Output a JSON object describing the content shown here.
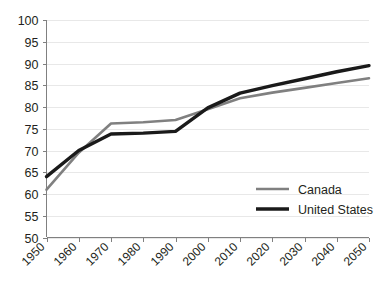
{
  "chart_data": {
    "type": "line",
    "title": "",
    "subtitle": "",
    "xlabel": "",
    "ylabel": "",
    "grid": true,
    "legend_position": "inside-bottom-right",
    "x": [
      1950,
      1960,
      1970,
      1980,
      1990,
      2000,
      2010,
      2020,
      2030,
      2040,
      2050
    ],
    "categories": [
      "1950",
      "1960",
      "1970",
      "1980",
      "1990",
      "2000",
      "2010",
      "2020",
      "2030",
      "2040",
      "2050"
    ],
    "xlim": [
      1950,
      2050
    ],
    "ylim": [
      50,
      100
    ],
    "yticks": [
      50,
      55,
      60,
      65,
      70,
      75,
      80,
      85,
      90,
      95,
      100
    ],
    "ytick_labels": [
      "50",
      "55",
      "60",
      "65",
      "70",
      "75",
      "80",
      "85",
      "90",
      "95",
      "100"
    ],
    "series": [
      {
        "name": "Canada",
        "color": "#808080",
        "values": [
          61.0,
          69.5,
          76.2,
          76.5,
          77.0,
          79.5,
          82.0,
          83.3,
          84.4,
          85.5,
          86.6
        ]
      },
      {
        "name": "United States",
        "color": "#1a1a1a",
        "values": [
          64.0,
          70.0,
          73.8,
          74.0,
          74.4,
          79.8,
          83.2,
          84.9,
          86.5,
          88.1,
          89.5
        ]
      }
    ]
  },
  "legend": {
    "items": [
      {
        "label": "Canada",
        "color": "#808080",
        "width": 2.6
      },
      {
        "label": "United States",
        "color": "#1a1a1a",
        "width": 3.4
      }
    ]
  },
  "axes": {
    "y_axis_color": "#808080",
    "x_axis_color": "#808080",
    "gridline_color": "#e8e8e8"
  }
}
